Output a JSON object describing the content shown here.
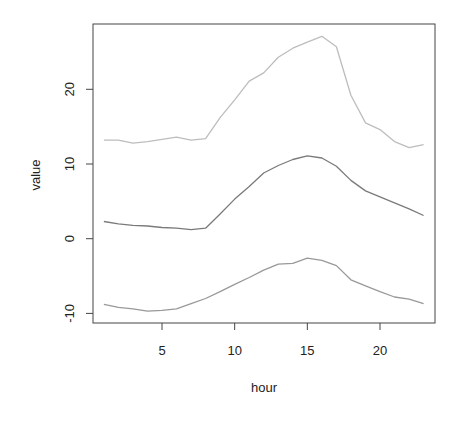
{
  "chart_data": {
    "type": "line",
    "title": "",
    "xlabel": "hour",
    "ylabel": "value",
    "xlim": [
      1,
      23
    ],
    "ylim": [
      -11,
      28
    ],
    "x_ticks": [
      5,
      10,
      15,
      20
    ],
    "y_ticks": [
      -10,
      0,
      10,
      20
    ],
    "grid": false,
    "legend": null,
    "x": [
      1,
      2,
      3,
      4,
      5,
      6,
      7,
      8,
      9,
      10,
      11,
      12,
      13,
      14,
      15,
      16,
      17,
      18,
      19,
      20,
      21,
      22,
      23
    ],
    "series": [
      {
        "name": "upper",
        "color": "#bdbdbd",
        "values": [
          13.2,
          13.2,
          12.8,
          13.0,
          13.3,
          13.6,
          13.2,
          13.4,
          16.2,
          18.6,
          21.1,
          22.2,
          24.3,
          25.5,
          26.3,
          27.1,
          25.7,
          19.2,
          15.5,
          14.6,
          13.0,
          12.2,
          12.6
        ]
      },
      {
        "name": "middle",
        "color": "#7a7a7a",
        "values": [
          2.3,
          2.0,
          1.8,
          1.7,
          1.5,
          1.4,
          1.2,
          1.4,
          3.3,
          5.3,
          7.0,
          8.8,
          9.8,
          10.6,
          11.1,
          10.8,
          9.7,
          7.8,
          6.4,
          5.6,
          4.8,
          4.0,
          3.1
        ]
      },
      {
        "name": "lower",
        "color": "#999999",
        "values": [
          -8.8,
          -9.2,
          -9.4,
          -9.7,
          -9.6,
          -9.4,
          -8.7,
          -8.0,
          -7.1,
          -6.1,
          -5.2,
          -4.2,
          -3.4,
          -3.3,
          -2.6,
          -2.9,
          -3.6,
          -5.5,
          -6.3,
          -7.1,
          -7.8,
          -8.1,
          -8.7
        ]
      }
    ]
  },
  "labels": {
    "x_axis": "hour",
    "y_axis": "value",
    "x_ticks": [
      "5",
      "10",
      "15",
      "20"
    ],
    "y_ticks": [
      "-10",
      "0",
      "10",
      "20"
    ]
  }
}
